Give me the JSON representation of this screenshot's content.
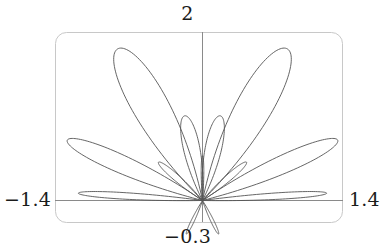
{
  "figure": {
    "kind": "polar-rose-curve-plot",
    "background_color": "#ffffff",
    "curve_color": "#555555",
    "axis_color": "#888888",
    "frame_color": "#c8c8c8",
    "label_color": "#1b1b1b"
  },
  "labels": {
    "top": "2",
    "bottom": "−0.3",
    "left": "−1.4",
    "right": "1.4"
  },
  "chart_data": {
    "type": "line",
    "title": "",
    "xlabel": "",
    "ylabel": "",
    "plot_style": "parametric-polar",
    "grid": false,
    "legend": false,
    "xlim": [
      -1.4,
      1.4
    ],
    "ylim": [
      -0.3,
      2
    ],
    "x_tick_labels": [
      "−1.4",
      "1.4"
    ],
    "y_tick_labels": [
      "−0.3",
      "2"
    ],
    "axis_origin": [
      0,
      0
    ],
    "series": [
      {
        "name": "rose-curve",
        "equation_family": "r = cos(k*theta) style multi-petal rose",
        "petal_count": 13,
        "notes": "Petal lobes radiate from the origin; symmetric about the vertical axis. Lobe lengths decrease from the two tall upper lobes down to short lobes near and below the horizontal axis.",
        "petals": [
          {
            "angle_deg": 115,
            "length": 1.95,
            "half_width_deg": 15,
            "label": "upper-left-large"
          },
          {
            "angle_deg": 65,
            "length": 1.95,
            "half_width_deg": 15,
            "label": "upper-right-large"
          },
          {
            "angle_deg": 152,
            "length": 1.5,
            "half_width_deg": 11,
            "label": "left-diagonal-large"
          },
          {
            "angle_deg": 28,
            "length": 1.5,
            "half_width_deg": 11,
            "label": "right-diagonal-large"
          },
          {
            "angle_deg": 100,
            "length": 1.0,
            "half_width_deg": 13,
            "label": "inner-left-medium"
          },
          {
            "angle_deg": 80,
            "length": 1.0,
            "half_width_deg": 13,
            "label": "inner-right-medium"
          },
          {
            "angle_deg": 134,
            "length": 0.62,
            "half_width_deg": 9,
            "label": "inner-left-small"
          },
          {
            "angle_deg": 46,
            "length": 0.62,
            "half_width_deg": 9,
            "label": "inner-right-small"
          },
          {
            "angle_deg": 176,
            "length": 1.22,
            "half_width_deg": 5,
            "label": "left-horizontal-flat"
          },
          {
            "angle_deg": 4,
            "length": 1.22,
            "half_width_deg": 5,
            "label": "right-horizontal-flat"
          },
          {
            "angle_deg": 90,
            "length": 0.52,
            "half_width_deg": 4,
            "label": "center-vertical-thin"
          },
          {
            "angle_deg": 248,
            "length": 0.42,
            "half_width_deg": 6,
            "label": "lower-left-small"
          },
          {
            "angle_deg": 292,
            "length": 0.42,
            "half_width_deg": 6,
            "label": "lower-right-small"
          }
        ]
      }
    ],
    "frame": {
      "left": -1.4,
      "right": 1.4,
      "bottom": -0.3,
      "top": 2.0,
      "rounded": true
    }
  }
}
